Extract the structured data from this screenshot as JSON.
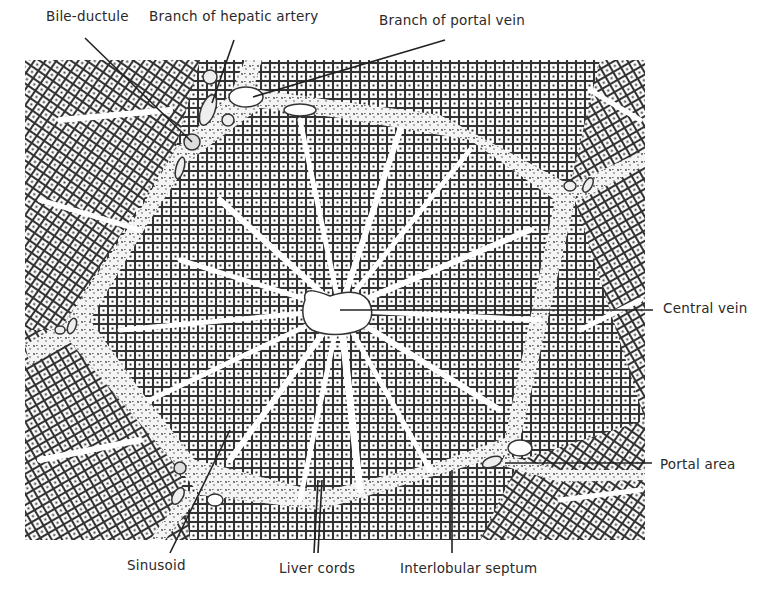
{
  "figure": {
    "colors": {
      "ink": "#2a2a2a",
      "paper": "#ffffff",
      "tissue": "#d8d8d8",
      "septum": "#f2f2f2"
    }
  },
  "labels": {
    "bile_ductule": "Bile-ductule",
    "hepatic_artery": "Branch of hepatic artery",
    "portal_vein": "Branch of portal vein",
    "central_vein": "Central vein",
    "portal_area": "Portal area",
    "sinusoid": "Sinusoid",
    "liver_cords": "Liver cords",
    "interlobular_septum": "Interlobular septum"
  }
}
